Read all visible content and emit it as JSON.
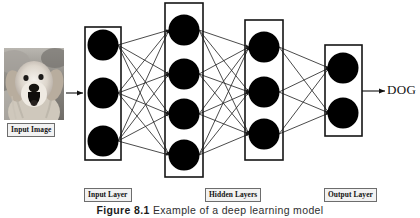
{
  "figure": {
    "caption_number": "Figure 8.1",
    "caption_text": "Example of a deep learning model",
    "output_label": "DOG"
  },
  "labels": {
    "input_image": "Input Image",
    "input_layer": "Input Layer",
    "hidden_layers": "Hidden Layers",
    "output_layer": "Output Layer"
  },
  "diagram_data": {
    "type": "neural-network-diagram",
    "layers": [
      {
        "name": "Input Layer",
        "node_count": 3,
        "box": {
          "x": 85,
          "y": 27,
          "w": 36,
          "h": 133
        },
        "node_radius": 15.5,
        "node_cx": 103,
        "node_cy": [
          45,
          93,
          141
        ]
      },
      {
        "name": "Hidden Layer 1",
        "node_count": 4,
        "box": {
          "x": 165,
          "y": 3,
          "w": 38,
          "h": 174
        },
        "node_radius": 15.5,
        "node_cx": 184,
        "node_cy": [
          30,
          74,
          114,
          155
        ]
      },
      {
        "name": "Hidden Layer 2",
        "node_count": 3,
        "box": {
          "x": 245,
          "y": 20,
          "w": 38,
          "h": 140
        },
        "node_radius": 15.5,
        "node_cx": 264,
        "node_cy": [
          47,
          92,
          134
        ]
      },
      {
        "name": "Output Layer",
        "node_count": 2,
        "box": {
          "x": 325,
          "y": 45,
          "w": 37,
          "h": 91
        },
        "node_radius": 15.5,
        "node_cx": 343,
        "node_cy": [
          68,
          113
        ]
      }
    ],
    "fully_connected": true,
    "node_color": "#000000",
    "box_stroke_color": "#1a1a1a",
    "edge_color": "#2a2a2a",
    "input_arrow": {
      "x1": 66,
      "y1": 93,
      "x2": 83,
      "y2": 93
    },
    "output_arrow": {
      "x1": 364,
      "y1": 91,
      "x2": 385,
      "y2": 91
    }
  }
}
